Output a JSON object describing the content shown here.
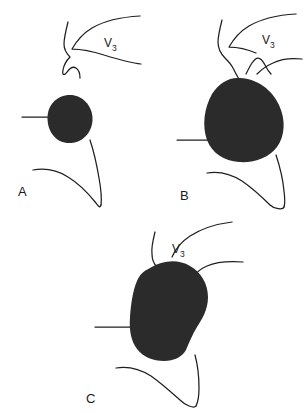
{
  "figure": {
    "background_color": "#ffffff",
    "ink_color": "#1f1f1f",
    "mass_fill_color": "#2b2b2b",
    "caption_letters": [
      "A",
      "B",
      "C"
    ],
    "panels": [
      {
        "id": "A",
        "letter": "A",
        "letter_x": 18,
        "letter_y": 196,
        "vessel_label": "V",
        "vessel_label_subscript": "3",
        "vessel_label_x": 104,
        "vessel_label_y": 47,
        "mass_description": "small rounded tumor mass",
        "mass_path": "M 70 95 C 82 95 92 105 92.5 118 C 93 131 84 142 71 143 C 57 144 48 133 47.5 119 C 47 105 57 95 70 95 Z",
        "lines": [
          "M 22 117 L 52 117",
          "M 68 22 C 66 30 64 38 64 44 C 64 50 67 54 70 57 C 67 60 64 64 63 70 C 62 75 64 76 67 72 C 70 68 73 66 76 68 C 79 70 80 74 80 78",
          "M 140 16 C 122 17 104 21 92 28 C 82 34 76 42 72 49 C 80 49 92 51 104 55 C 117 59 130 63 141 64",
          "M 90 140 C 94 152 97 166 99 178 C 101 189 102 197 101 205",
          "M 33 170 C 45 168 57 170 68 177 C 78 183 88 193 96 203 C 99 207 100 208 101 205"
        ]
      },
      {
        "id": "B",
        "letter": "B",
        "letter_x": 180,
        "letter_y": 200,
        "vessel_label": "V",
        "vessel_label_subscript": "3",
        "vessel_label_x": 262,
        "vessel_label_y": 44,
        "mass_description": "medium enlarged tumor mass displacing vessel",
        "mass_path": "M 240 78 C 258 79 272 90 279 105 C 286 120 285 136 277 147 C 269 158 254 163 239 162 C 224 161 212 153 207 140 C 202 126 204 108 212 94 C 219 83 229 77 240 78 Z",
        "lines": [
          "M 177 140 L 212 140",
          "M 222 20 C 220 28 218 36 218 42 C 218 49 221 54 225 58 C 228 61 231 64 233 68 C 235 72 237 76 239 79",
          "M 296 14 C 278 15 261 19 249 26 C 239 32 233 40 229 47 C 237 47 247 49 256 53",
          "M 246 74 C 248 70 250 66 252 63 C 254 60 256 58 258 58 C 261 58 263 61 265 65 C 267 69 269 72 271 74",
          "M 302 59 C 292 58 281 59 273 63 C 266 66 261 70 257 74",
          "M 276 155 C 280 167 283 180 284 191 C 285 199 285 204 284 207",
          "M 207 173 C 219 171 231 174 242 181 C 252 188 262 197 270 205 C 274 209 283 210 284 207"
        ]
      },
      {
        "id": "C",
        "letter": "C",
        "letter_x": 86,
        "letter_y": 403,
        "vessel_label": "V",
        "vessel_label_subscript": "3",
        "vessel_label_x": 172,
        "vessel_label_y": 253,
        "mass_description": "large lobulated tumor mass with notch encasing vessel",
        "mass_path": "M 150 268 C 163 260 178 259 190 266 C 201 272 208 284 208 297 C 208 310 202 319 197 327 C 192 335 189 343 186 350 C 182 357 174 361 164 361 C 153 361 143 357 137 349 C 131 341 129 330 130 317 C 131 303 133 290 137 281 C 140 274 144 271 150 268 Z",
        "lines": [
          "M 95 327 L 137 327",
          "M 155 232 C 153 240 151 248 152 254 C 152 260 154 264 157 267",
          "M 232 222 C 216 224 201 229 190 236 C 181 242 175 250 172 257",
          "M 243 262 C 229 261 216 262 207 266 C 200 269 196 273 193 277",
          "M 195 355 C 198 366 199 378 199 388 C 199 396 198 402 196 406",
          "M 116 368 C 128 366 140 369 151 376 C 161 383 171 392 180 400 C 185 405 194 409 196 406"
        ]
      }
    ]
  }
}
